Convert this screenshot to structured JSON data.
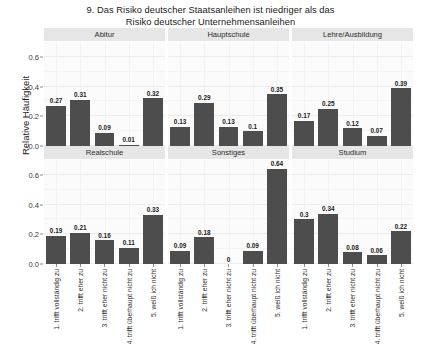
{
  "chart_data": {
    "type": "bar",
    "title": "9. Das Risiko deutscher Staatsanleihen ist niedriger als das Risiko deutscher Unternehmensanleihen",
    "title_lines": [
      "9. Das Risiko deutscher Staatsanleihen ist niedriger als das",
      "Risiko deutscher Unternehmensanleihen"
    ],
    "xlabel": "",
    "ylabel": "Relative Häufigkeit",
    "ylim": [
      0,
      0.7
    ],
    "yticks": [
      0.0,
      0.2,
      0.4,
      0.6
    ],
    "ytick_labels": [
      "0.0",
      "0.2",
      "0.4",
      "0.6"
    ],
    "grid": true,
    "legend": null,
    "facet_layout": {
      "rows": 2,
      "cols": 3
    },
    "categories": [
      "1. trifft vollständig zu",
      "2. trifft eher zu",
      "3. trifft eher nicht zu",
      "4. trifft überhaupt nicht zu",
      "5. weiß ich nicht"
    ],
    "bar_color": "#4d4d4d",
    "strip_color": "#e6e6e6",
    "panel_color": "#fbfbfb",
    "panels": [
      {
        "label": "Abitur",
        "values": [
          0.27,
          0.31,
          0.09,
          0.01,
          0.32
        ],
        "value_labels": [
          "0.27",
          "0.31",
          "0.09",
          "0.01",
          "0.32"
        ]
      },
      {
        "label": "Hauptschule",
        "values": [
          0.13,
          0.29,
          0.13,
          0.1,
          0.35
        ],
        "value_labels": [
          "0.13",
          "0.29",
          "0.13",
          "0.1",
          "0.35"
        ]
      },
      {
        "label": "Lehre/Ausbildung",
        "values": [
          0.17,
          0.25,
          0.12,
          0.07,
          0.39
        ],
        "value_labels": [
          "0.17",
          "0.25",
          "0.12",
          "0.07",
          "0.39"
        ]
      },
      {
        "label": "Realschule",
        "values": [
          0.19,
          0.21,
          0.16,
          0.11,
          0.33
        ],
        "value_labels": [
          "0.19",
          "0.21",
          "0.16",
          "0.11",
          "0.33"
        ]
      },
      {
        "label": "Sonstiges",
        "values": [
          0.09,
          0.18,
          0,
          0.09,
          0.64
        ],
        "value_labels": [
          "0.09",
          "0.18",
          "0",
          "0.09",
          "0.64"
        ]
      },
      {
        "label": "Studium",
        "values": [
          0.3,
          0.34,
          0.08,
          0.06,
          0.22
        ],
        "value_labels": [
          "0.3",
          "0.34",
          "0.08",
          "0.06",
          "0.22"
        ]
      }
    ]
  }
}
